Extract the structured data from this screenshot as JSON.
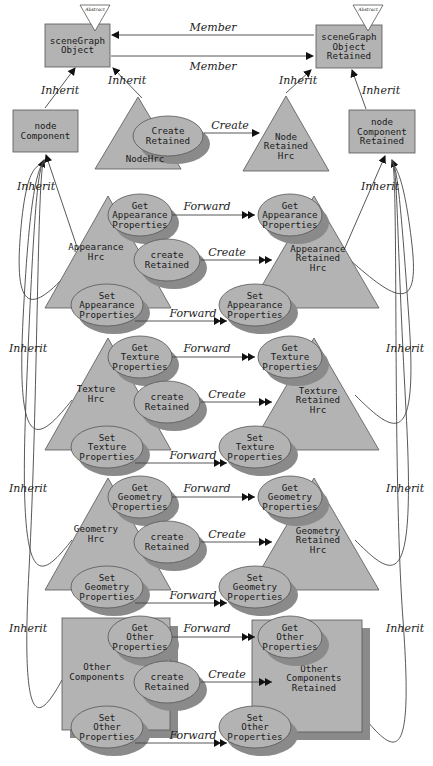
{
  "diagram": {
    "top": {
      "scene_graph_object": {
        "lines": [
          "sceneGraph",
          "Object"
        ],
        "badge": "Abstract"
      },
      "scene_graph_object_retained": {
        "lines": [
          "sceneGraph",
          "Object",
          "Retained"
        ],
        "badge": "Abstract"
      },
      "node_component": {
        "lines": [
          "node",
          "Component"
        ]
      },
      "node_component_retained": {
        "lines": [
          "node",
          "Component",
          "Retained"
        ]
      },
      "node_hrc": {
        "label": "NodeHrc",
        "method": [
          "Create",
          "Retained"
        ]
      },
      "node_retained_hrc": {
        "lines": [
          "Node",
          "Retained",
          "Hrc"
        ]
      },
      "edges": {
        "member_top": "Member",
        "member_bottom": "Member",
        "inherit": "Inherit",
        "create": "Create"
      }
    },
    "sections": [
      {
        "name": "appearance",
        "left": [
          "Appearance",
          "Hrc"
        ],
        "right": [
          "Appearance",
          "Retained",
          "Hrc"
        ],
        "get": [
          "Get",
          "Appearance",
          "Properties"
        ],
        "create": [
          "create",
          "Retained"
        ],
        "set": [
          "Set",
          "Appearance",
          "Properties"
        ],
        "get_right": [
          "Get",
          "Appearance",
          "Properties"
        ],
        "set_right": [
          "Set",
          "Appearance",
          "Properties"
        ]
      },
      {
        "name": "texture",
        "left": [
          "Texture",
          "Hrc"
        ],
        "right": [
          "Texture",
          "Retained",
          "Hrc"
        ],
        "get": [
          "Get",
          "Texture",
          "Properties"
        ],
        "create": [
          "create",
          "Retained"
        ],
        "set": [
          "Set",
          "Texture",
          "Properties"
        ],
        "get_right": [
          "Get",
          "Texture",
          "Properties"
        ],
        "set_right": [
          "Set",
          "Texture",
          "Properties"
        ]
      },
      {
        "name": "geometry",
        "left": [
          "Geometry",
          "Hrc"
        ],
        "right": [
          "Geometry",
          "Retained",
          "Hrc"
        ],
        "get": [
          "Get",
          "Geometry",
          "Properties"
        ],
        "create": [
          "create",
          "Retained"
        ],
        "set": [
          "Set",
          "Geometry",
          "Properties"
        ],
        "get_right": [
          "Get",
          "Geometry",
          "Properties"
        ],
        "set_right": [
          "Set",
          "Geometry",
          "Properties"
        ]
      },
      {
        "name": "other",
        "left": [
          "Other",
          "Components"
        ],
        "right": [
          "Other",
          "Components",
          "Retained"
        ],
        "get": [
          "Get",
          "Other",
          "Properties"
        ],
        "create": [
          "create",
          "Retained"
        ],
        "set": [
          "Set",
          "Other",
          "Properties"
        ],
        "get_right": [
          "Get",
          "Other",
          "Properties"
        ],
        "set_right": [
          "Set",
          "Other",
          "Properties"
        ]
      }
    ],
    "edge_labels": {
      "forward": "Forward",
      "create": "Create",
      "inherit": "Inherit"
    }
  }
}
